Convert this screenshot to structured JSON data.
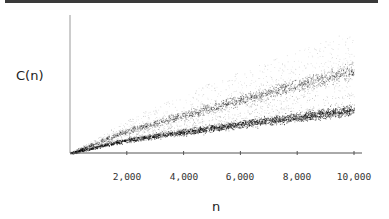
{
  "chart_data": {
    "type": "scatter",
    "title": "",
    "xlabel": "n",
    "ylabel": "C(n)",
    "xlim": [
      0,
      10000
    ],
    "x_ticks": [
      2000,
      4000,
      6000,
      8000,
      10000
    ],
    "x_tick_labels": [
      "2,000",
      "4,000",
      "6,000",
      "8,000",
      "10,000"
    ],
    "y_ticks": [],
    "grid": false,
    "legend": null,
    "series": [
      {
        "name": "upper band",
        "x": [
          0,
          2000,
          4000,
          6000,
          8000,
          10000
        ],
        "values": [
          0,
          22,
          38,
          53,
          68,
          83
        ]
      },
      {
        "name": "lower band",
        "x": [
          0,
          2000,
          4000,
          6000,
          8000,
          10000
        ],
        "values": [
          0,
          13,
          21,
          29,
          36,
          43
        ]
      },
      {
        "name": "upper envelope (sparse)",
        "x": [
          0,
          2000,
          4000,
          6000,
          8000,
          10000
        ],
        "values": [
          0,
          33,
          60,
          82,
          103,
          123
        ]
      }
    ]
  },
  "axes": {
    "ylabel": "C(n)",
    "xlabel": "n",
    "ticks": [
      "2,000",
      "4,000",
      "6,000",
      "8,000",
      "10,000"
    ]
  }
}
